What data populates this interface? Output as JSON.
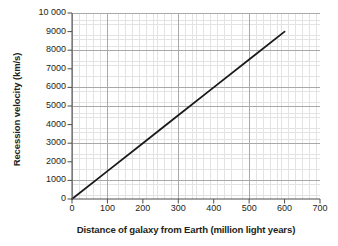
{
  "chart_data": {
    "type": "line",
    "title": "",
    "xlabel": "Distance of galaxy from Earth (million light years)",
    "ylabel": "Recession velocity (km/s)",
    "xlim": [
      0,
      700
    ],
    "ylim": [
      0,
      10000
    ],
    "xticks": [
      0,
      100,
      200,
      300,
      400,
      500,
      600,
      700
    ],
    "xtick_labels": [
      "0",
      "100",
      "200",
      "300",
      "400",
      "500",
      "600",
      "700"
    ],
    "yticks": [
      0,
      1000,
      2000,
      3000,
      4000,
      5000,
      6000,
      7000,
      8000,
      9000,
      10000
    ],
    "ytick_labels": [
      "0",
      "1000",
      "2000",
      "3000",
      "4000",
      "5000",
      "6000",
      "7000",
      "8000",
      "9000",
      "10 000"
    ],
    "grid": true,
    "grid_minor": true,
    "legend": false,
    "series": [
      {
        "name": "Hubble relation",
        "color": "#1a1a1a",
        "x": [
          0,
          100,
          200,
          300,
          400,
          500,
          600
        ],
        "values": [
          0,
          1500,
          3000,
          4500,
          6000,
          7500,
          9000
        ]
      }
    ],
    "annotations": []
  },
  "colors": {
    "background": "#ffffff",
    "axis": "#4d4d4d",
    "grid_major": "#a9a9a9",
    "grid_minor": "#e3e3e3",
    "data_line": "#1a1a1a",
    "text": "#231f20"
  }
}
